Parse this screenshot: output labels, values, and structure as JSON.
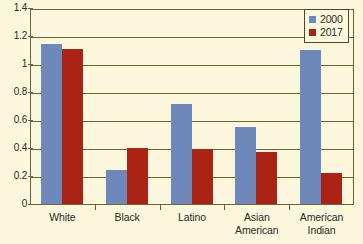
{
  "chart_data": {
    "type": "bar",
    "title": "",
    "subtitle": "",
    "xlabel": "",
    "ylabel": "",
    "categories": [
      "White",
      "Black",
      "Latino",
      "Asian American",
      "American Indian"
    ],
    "category_lines": [
      [
        "White"
      ],
      [
        "Black"
      ],
      [
        "Latino"
      ],
      [
        "Asian",
        "American"
      ],
      [
        "American",
        "Indian"
      ]
    ],
    "series": [
      {
        "name": "2000",
        "color": "#6f88bc",
        "values": [
          1.14,
          0.24,
          0.715,
          0.55,
          1.1
        ]
      },
      {
        "name": "2017",
        "color": "#ab2314",
        "values": [
          1.11,
          0.4,
          0.39,
          0.375,
          0.22
        ]
      }
    ],
    "ylim": [
      0,
      1.4
    ],
    "ytick_values": [
      0,
      0.2,
      0.4,
      0.6,
      0.8,
      1,
      1.2,
      1.4
    ],
    "ytick_labels": [
      "0",
      "0.2",
      "0.4",
      "0.6",
      "0.8",
      "1",
      "1.2",
      "1.4"
    ],
    "grid": true,
    "legend_position": "top-right",
    "legend_entries": [
      "2000",
      "2017"
    ],
    "plot_background": "#fbf7dc",
    "grid_color": "#6d6535",
    "text_color": "#2b2b24"
  },
  "legend": {
    "entries": [
      {
        "label": "2000",
        "color": "#6f88bc"
      },
      {
        "label": "2017",
        "color": "#ab2314"
      }
    ]
  },
  "axes": {
    "y_ticks": [
      "1.4",
      "1.2",
      "1",
      "0.8",
      "0.6",
      "0.4",
      "0.2",
      "0"
    ],
    "x_categories": [
      "White",
      "Black",
      "Latino",
      "Asian American",
      "American Indian"
    ]
  }
}
